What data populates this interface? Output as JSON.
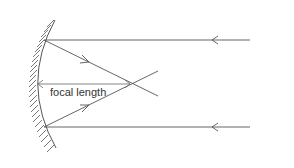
{
  "diagram": {
    "label_focal_length": "focal length",
    "colors": {
      "line": "#555555",
      "text": "#333333",
      "background": "#ffffff"
    },
    "elements": [
      {
        "type": "concave-mirror",
        "hatched": true
      },
      {
        "type": "incident-ray",
        "position": "top",
        "direction": "left"
      },
      {
        "type": "incident-ray",
        "position": "bottom",
        "direction": "left"
      },
      {
        "type": "reflected-ray",
        "from": "top",
        "through": "focal-point"
      },
      {
        "type": "reflected-ray",
        "from": "bottom",
        "through": "focal-point"
      },
      {
        "type": "dimension-arrow",
        "label": "focal length"
      }
    ]
  }
}
